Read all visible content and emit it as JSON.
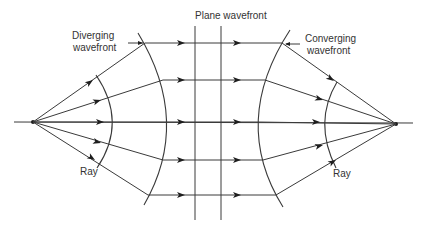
{
  "diagram": {
    "labels": {
      "diverging_line1": "Diverging",
      "diverging_line2": "wavefront",
      "plane": "Plane wavefront",
      "converging_line1": "Converging",
      "converging_line2": "wavefront",
      "ray_left": "Ray",
      "ray_right": "Ray"
    },
    "colors": {
      "line": "#3a3a3a",
      "text": "#333333",
      "background": "#ffffff"
    },
    "points": {
      "left_focus": [
        33,
        122
      ],
      "right_focus": [
        396,
        124
      ]
    },
    "ray_count": 5
  }
}
